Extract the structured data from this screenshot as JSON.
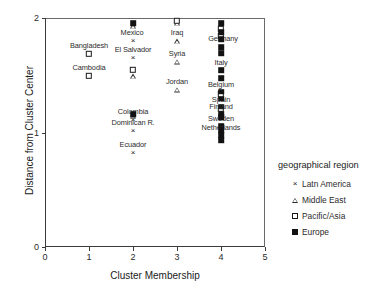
{
  "chart_data": {
    "type": "scatter",
    "title": "",
    "xlabel": "Cluster Membership",
    "ylabel": "Distance from Cluster Center",
    "xlim": [
      0,
      5
    ],
    "ylim": [
      0,
      2
    ],
    "xticks": [
      "0",
      "1",
      "2",
      "3",
      "4",
      "5"
    ],
    "yticks": [
      "0",
      "1",
      "2"
    ],
    "grid": false,
    "legend": {
      "title": "geographical region",
      "position": "right",
      "entries": [
        {
          "label": "Latn America",
          "marker": "cross-marker"
        },
        {
          "label": "Middle East",
          "marker": "triangle-marker"
        },
        {
          "label": "Pacific/Asia",
          "marker": "open-square-marker"
        },
        {
          "label": "Europe",
          "marker": "filled-square-marker"
        }
      ]
    },
    "series": [
      {
        "name": "Latn America",
        "marker": "cross-marker",
        "points": [
          {
            "label": "Mexico",
            "x": 2.0,
            "y": 1.8,
            "label_dx": -1,
            "label_dy": -9
          },
          {
            "label": "El Salvador",
            "x": 2.0,
            "y": 1.655,
            "label_dx": 0,
            "label_dy": -9
          },
          {
            "label": "Colombia",
            "x": 2.0,
            "y": 1.105,
            "label_dx": 0,
            "label_dy": -9
          },
          {
            "label": "Dominican R.",
            "x": 2.0,
            "y": 1.01,
            "label_dx": 0,
            "label_dy": -9
          },
          {
            "label": "Ecuador",
            "x": 2.0,
            "y": 0.82,
            "label_dx": 0,
            "label_dy": -9
          }
        ]
      },
      {
        "name": "Middle East",
        "marker": "triangle-marker",
        "points": [
          {
            "label": "Iraq",
            "x": 3.0,
            "y": 1.795,
            "label_dx": 0,
            "label_dy": -9
          },
          {
            "label": "Syria",
            "x": 3.0,
            "y": 1.62,
            "label_dx": 0,
            "label_dy": -9
          },
          {
            "label": "Jordan",
            "x": 3.0,
            "y": 1.375,
            "label_dx": 0,
            "label_dy": -9
          },
          {
            "label": "",
            "x": 3.0,
            "y": 1.955,
            "label_dx": 0,
            "label_dy": 0
          },
          {
            "label": "",
            "x": 2.0,
            "y": 1.49,
            "label_dx": 0,
            "label_dy": 0
          },
          {
            "label": "",
            "x": 2.0,
            "y": 1.145,
            "label_dx": 0,
            "label_dy": 0
          },
          {
            "label": "",
            "x": 2.0,
            "y": 1.93,
            "label_dx": 0,
            "label_dy": 0
          }
        ]
      },
      {
        "name": "Pacific/Asia",
        "marker": "open-square-marker",
        "points": [
          {
            "label": "Bangladesh",
            "x": 1.0,
            "y": 1.685,
            "label_dx": 0,
            "label_dy": -9
          },
          {
            "label": "Cambodia",
            "x": 1.0,
            "y": 1.495,
            "label_dx": 0,
            "label_dy": -9
          },
          {
            "label": "",
            "x": 2.0,
            "y": 1.545,
            "label_dx": 0,
            "label_dy": 0
          },
          {
            "label": "",
            "x": 3.0,
            "y": 1.975,
            "label_dx": 0,
            "label_dy": 0
          },
          {
            "label": "",
            "x": 4.0,
            "y": 1.905,
            "label_dx": 0,
            "label_dy": 0
          },
          {
            "label": "",
            "x": 4.0,
            "y": 1.845,
            "label_dx": 0,
            "label_dy": 0
          },
          {
            "label": "",
            "x": 4.0,
            "y": 1.335,
            "label_dx": 0,
            "label_dy": 0
          },
          {
            "label": "",
            "x": 4.0,
            "y": 1.205,
            "label_dx": 0,
            "label_dy": 0
          }
        ]
      },
      {
        "name": "Europe",
        "marker": "filled-square-marker",
        "points": [
          {
            "label": "Germany",
            "x": 4.0,
            "y": 1.745,
            "label_dx": 2,
            "label_dy": -9
          },
          {
            "label": "Italy",
            "x": 4.0,
            "y": 1.545,
            "label_dx": 0,
            "label_dy": -8
          },
          {
            "label": "Belgium",
            "x": 4.0,
            "y": 1.355,
            "label_dx": 0,
            "label_dy": -8
          },
          {
            "label": "Spain",
            "x": 4.0,
            "y": 1.225,
            "label_dx": 0,
            "label_dy": -8
          },
          {
            "label": "Finland",
            "x": 4.0,
            "y": 1.16,
            "label_dx": 0,
            "label_dy": -8
          },
          {
            "label": "Sweden",
            "x": 4.0,
            "y": 1.06,
            "label_dx": 0,
            "label_dy": -8
          },
          {
            "label": "Netherlands",
            "x": 4.0,
            "y": 0.975,
            "label_dx": 0,
            "label_dy": -8
          },
          {
            "label": "",
            "x": 4.0,
            "y": 1.955,
            "label_dx": 0,
            "label_dy": 0
          },
          {
            "label": "",
            "x": 4.0,
            "y": 1.875,
            "label_dx": 0,
            "label_dy": 0
          },
          {
            "label": "",
            "x": 4.0,
            "y": 1.815,
            "label_dx": 0,
            "label_dy": 0
          },
          {
            "label": "",
            "x": 4.0,
            "y": 1.69,
            "label_dx": 0,
            "label_dy": 0
          },
          {
            "label": "",
            "x": 4.0,
            "y": 1.475,
            "label_dx": 0,
            "label_dy": 0
          },
          {
            "label": "",
            "x": 4.0,
            "y": 1.295,
            "label_dx": 0,
            "label_dy": 0
          },
          {
            "label": "",
            "x": 4.0,
            "y": 1.135,
            "label_dx": 0,
            "label_dy": 0
          },
          {
            "label": "",
            "x": 4.0,
            "y": 1.02,
            "label_dx": 0,
            "label_dy": 0
          },
          {
            "label": "",
            "x": 4.0,
            "y": 0.935,
            "label_dx": 0,
            "label_dy": 0
          },
          {
            "label": "",
            "x": 2.0,
            "y": 1.955,
            "label_dx": 0,
            "label_dy": 0
          },
          {
            "label": "",
            "x": 2.0,
            "y": 1.16,
            "label_dx": 0,
            "label_dy": 0
          }
        ]
      }
    ]
  }
}
